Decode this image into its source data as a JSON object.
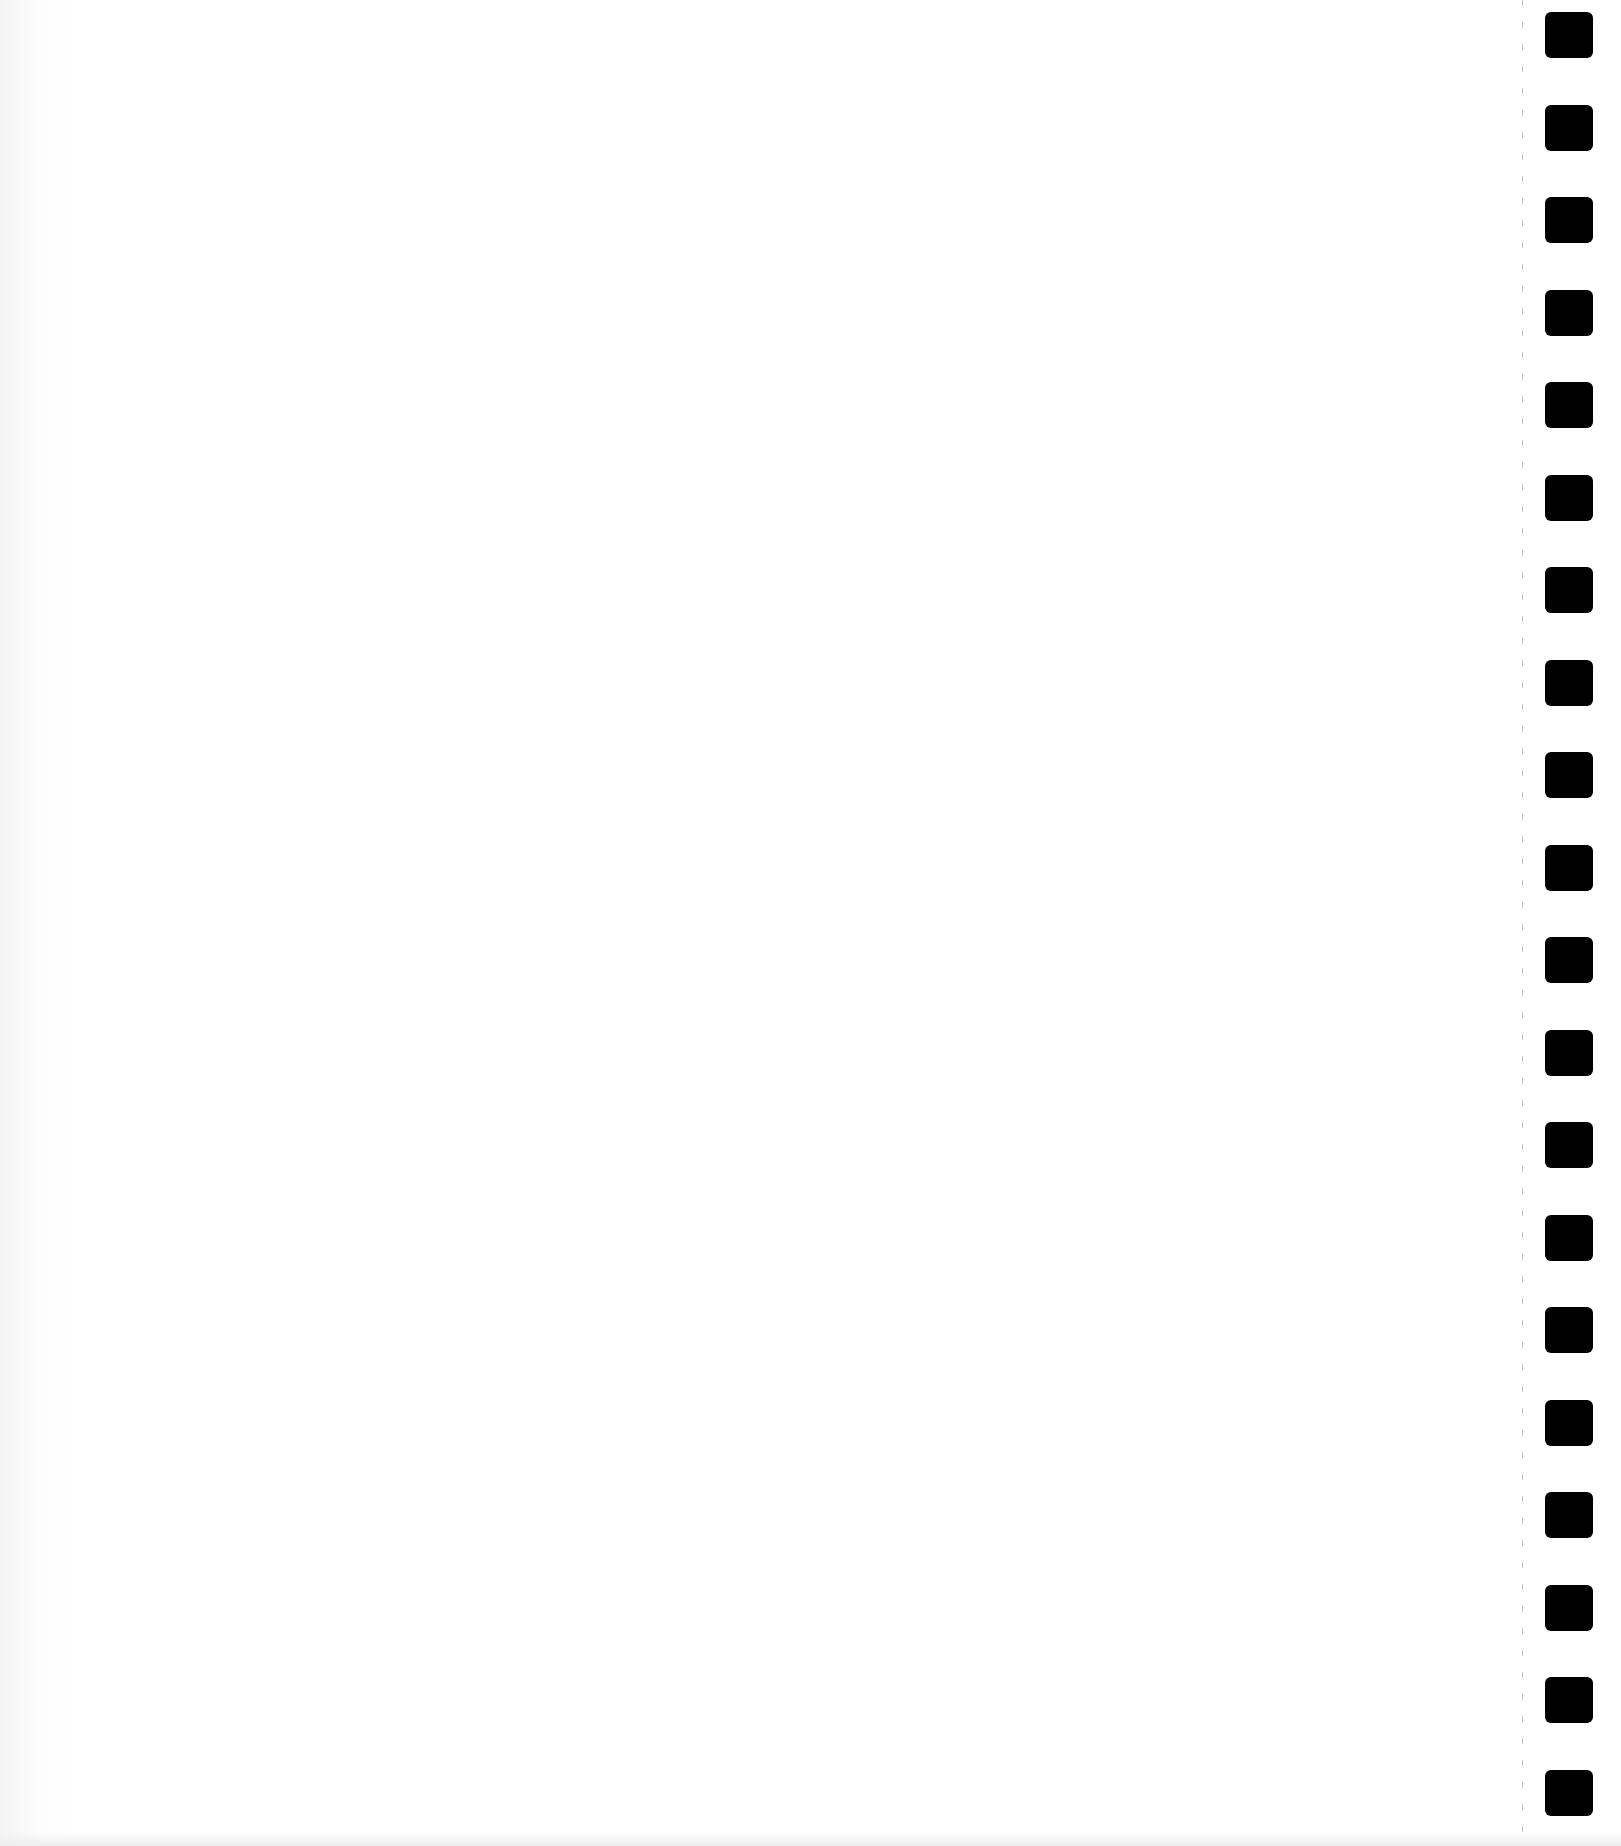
{
  "document": {
    "type": "blank scanned page",
    "text": "",
    "background_color": "#ffffff"
  },
  "binding": {
    "hole_count": 20,
    "hole_color": "#000000",
    "first_hole_top": 12,
    "hole_spacing": 92.5,
    "perforation_line": true
  }
}
